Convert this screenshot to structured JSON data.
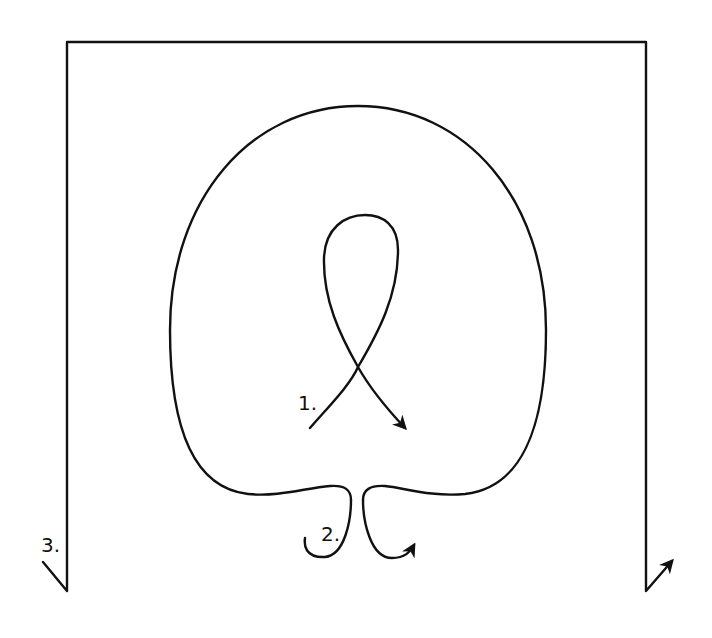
{
  "diagram": {
    "type": "path-diagram",
    "colors": {
      "stroke": "#111111",
      "background": "#ffffff"
    },
    "labels": [
      {
        "id": "1",
        "text": "1.",
        "target": "inner-ribbon-loop"
      },
      {
        "id": "2",
        "text": "2.",
        "target": "bottom-double-hook"
      },
      {
        "id": "3",
        "text": "3.",
        "target": "outer-frame"
      }
    ],
    "elements": [
      {
        "name": "outer-frame",
        "shape": "open rectangle",
        "ends": [
          "left diagonal tick",
          "right arrowhead up-right"
        ]
      },
      {
        "name": "large-loop",
        "shape": "rounded loop pinched at bottom center"
      },
      {
        "name": "inner-ribbon-loop",
        "shape": "crossing loop",
        "end": "arrowhead down-right"
      },
      {
        "name": "bottom-double-hook",
        "shape": "two opposing hooks",
        "end": "arrowhead on right hook"
      }
    ]
  }
}
